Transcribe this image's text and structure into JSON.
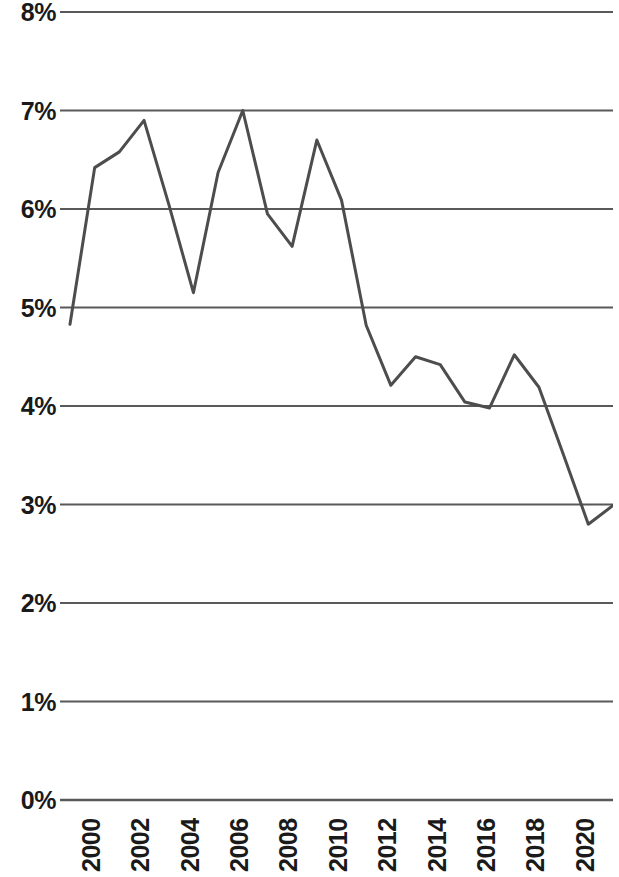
{
  "chart_data": {
    "type": "line",
    "title": "",
    "subtitle": "",
    "xlabel": "",
    "ylabel": "",
    "x": [
      2000,
      2001,
      2002,
      2003,
      2004,
      2005,
      2006,
      2007,
      2008,
      2009,
      2010,
      2011,
      2012,
      2013,
      2014,
      2015,
      2016,
      2017,
      2018,
      2019,
      2020,
      2021,
      2022
    ],
    "categories": [
      "2000",
      "2001",
      "2002",
      "2003",
      "2004",
      "2005",
      "2006",
      "2007",
      "2008",
      "2009",
      "2010",
      "2011",
      "2012",
      "2013",
      "2014",
      "2015",
      "2016",
      "2017",
      "2018",
      "2019",
      "2020",
      "2021",
      "2022"
    ],
    "values": [
      4.83,
      6.42,
      6.58,
      6.9,
      6.05,
      5.15,
      6.37,
      7.0,
      5.95,
      5.62,
      6.7,
      6.09,
      4.82,
      4.21,
      4.5,
      4.42,
      4.04,
      3.98,
      4.52,
      4.19,
      3.5,
      2.8,
      2.99
    ],
    "series": [
      {
        "name": "series-1",
        "color": "#4d4d4d",
        "values": [
          4.83,
          6.42,
          6.58,
          6.9,
          6.05,
          5.15,
          6.37,
          7.0,
          5.95,
          5.62,
          6.7,
          6.09,
          4.82,
          4.21,
          4.5,
          4.42,
          4.04,
          3.98,
          4.52,
          4.19,
          3.5,
          2.8,
          2.99
        ]
      }
    ],
    "ylim": [
      0,
      8
    ],
    "xlim": [
      2000,
      2022
    ],
    "y_ticks": [
      0,
      1,
      2,
      3,
      4,
      5,
      6,
      7,
      8
    ],
    "y_tick_labels": [
      "0%",
      "1%",
      "2%",
      "3%",
      "4%",
      "5%",
      "6%",
      "7%",
      "8%"
    ],
    "x_ticks": [
      2000,
      2002,
      2004,
      2006,
      2008,
      2010,
      2012,
      2014,
      2016,
      2018,
      2020,
      2022
    ],
    "x_tick_labels": [
      "2000",
      "2002",
      "2004",
      "2006",
      "2008",
      "2010",
      "2012",
      "2014",
      "2016",
      "2018",
      "2020",
      "2022"
    ],
    "x_tick_rotation": -90,
    "grid": true,
    "grid_axis": "y",
    "grid_color": "#595959",
    "legend": false,
    "legend_position": "none",
    "line_width": 3,
    "markers": false,
    "annotations": []
  }
}
